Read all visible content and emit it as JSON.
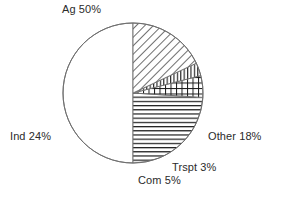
{
  "chart_data": {
    "type": "pie",
    "title": "",
    "subtitle": "",
    "xlabel": "",
    "ylabel": "",
    "legend_position": "none",
    "grid": false,
    "center": {
      "x": 133,
      "y": 93
    },
    "radius": 70,
    "start_angle_deg": 90,
    "direction": "counterclockwise",
    "labels": [
      "Ag",
      "Ind",
      "Com",
      "Trspt",
      "Other"
    ],
    "values": [
      50,
      24,
      5,
      3,
      18
    ],
    "unit": "%",
    "slices": [
      {
        "name": "Ag",
        "label": "Ag 50%",
        "value": 50,
        "fill": "none",
        "pattern": "solid-white",
        "color": "#ffffff",
        "stroke": "#6e6e6e"
      },
      {
        "name": "Ind",
        "label": "Ind 24%",
        "value": 24,
        "fill": "hatch",
        "pattern": "horizontal-lines",
        "color": "#1a1a1a",
        "stroke": "#6e6e6e"
      },
      {
        "name": "Com",
        "label": "Com 5%",
        "value": 5,
        "fill": "hatch",
        "pattern": "cross-hatch-grid",
        "color": "#1a1a1a",
        "stroke": "#6e6e6e"
      },
      {
        "name": "Trspt",
        "label": "Trspt 3%",
        "value": 3,
        "fill": "hatch",
        "pattern": "vertical-lines",
        "color": "#1a1a1a",
        "stroke": "#6e6e6e"
      },
      {
        "name": "Other",
        "label": "Other 18%",
        "value": 18,
        "fill": "hatch",
        "pattern": "diagonal-lines-forward",
        "color": "#1a1a1a",
        "stroke": "#6e6e6e"
      }
    ],
    "text_color": "#2b2b2b",
    "outline_color": "#6e6e6e",
    "background_color": "#ffffff"
  }
}
